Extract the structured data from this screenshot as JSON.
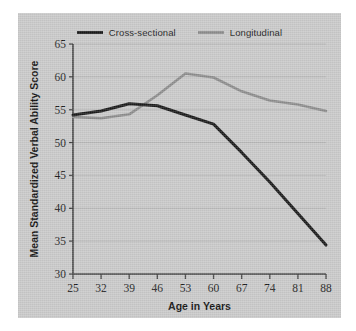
{
  "figure": {
    "panel_bg": "#c9c9c9",
    "page_bg": "#ffffff"
  },
  "legend": {
    "position": "top-center",
    "entries": [
      {
        "label": "Cross-sectional",
        "color": "#1a1a1a",
        "icon": "line-swatch-icon"
      },
      {
        "label": "Longitudinal",
        "color": "#8c8c8c",
        "icon": "line-swatch-icon"
      }
    ]
  },
  "axes": {
    "xlabel": "Age in Years",
    "ylabel": "Mean Standardized Verbal Ability Score",
    "xticks": [
      "25",
      "32",
      "39",
      "46",
      "53",
      "60",
      "67",
      "74",
      "81",
      "88"
    ],
    "yticks": [
      "30",
      "35",
      "40",
      "45",
      "50",
      "55",
      "60",
      "65"
    ]
  },
  "chart_data": {
    "type": "line",
    "title": "",
    "xlabel": "Age in Years",
    "ylabel": "Mean Standardized Verbal Ability Score",
    "x": [
      25,
      32,
      39,
      46,
      53,
      60,
      67,
      74,
      81,
      88
    ],
    "xlim": [
      25,
      88
    ],
    "ylim": [
      30,
      65
    ],
    "xticks": [
      25,
      32,
      39,
      46,
      53,
      60,
      67,
      74,
      81,
      88
    ],
    "yticks": [
      30,
      35,
      40,
      45,
      50,
      55,
      60,
      65
    ],
    "grid": "horizontal",
    "legend_position": "top-center",
    "series": [
      {
        "name": "Cross-sectional",
        "color": "#1a1a1a",
        "values": [
          54.2,
          54.8,
          55.9,
          55.6,
          54.2,
          52.8,
          48.5,
          44.0,
          39.2,
          34.4
        ]
      },
      {
        "name": "Longitudinal",
        "color": "#8c8c8c",
        "values": [
          53.9,
          53.7,
          54.3,
          57.2,
          60.5,
          59.9,
          57.8,
          56.4,
          55.8,
          54.8
        ]
      }
    ]
  }
}
